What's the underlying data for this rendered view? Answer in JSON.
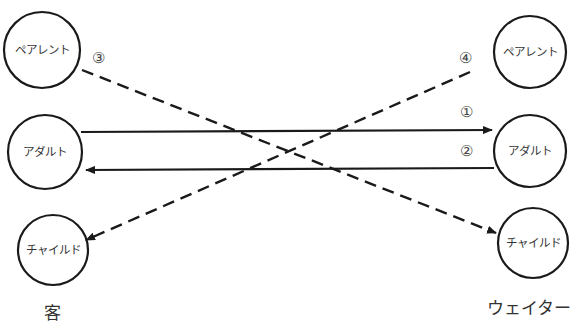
{
  "diagram": {
    "type": "transactional-analysis",
    "left_side": {
      "label": "客",
      "nodes": [
        {
          "id": "parent",
          "label": "ペアレント"
        },
        {
          "id": "adult",
          "label": "アダルト"
        },
        {
          "id": "child",
          "label": "チャイルド"
        }
      ]
    },
    "right_side": {
      "label": "ウェイター",
      "nodes": [
        {
          "id": "parent",
          "label": "ペアレント"
        },
        {
          "id": "adult",
          "label": "アダルト"
        },
        {
          "id": "child",
          "label": "チャイルド"
        }
      ]
    },
    "arrows": [
      {
        "label": "①",
        "from": "客.アダルト",
        "to": "ウェイター.アダルト",
        "style": "solid"
      },
      {
        "label": "②",
        "from": "ウェイター.アダルト",
        "to": "客.アダルト",
        "style": "solid"
      },
      {
        "label": "③",
        "from": "客.ペアレント",
        "to": "ウェイター.チャイルド",
        "style": "dashed"
      },
      {
        "label": "④",
        "from": "ウェイター.ペアレント",
        "to": "客.チャイルド",
        "style": "dashed"
      }
    ],
    "colors": {
      "stroke": "#1a1a1a",
      "text": "#333333",
      "background": "#ffffff"
    }
  }
}
